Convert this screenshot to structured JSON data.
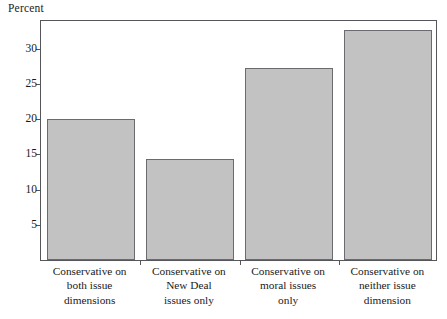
{
  "chart_data": {
    "type": "bar",
    "title": "",
    "ylabel": "Percent",
    "xlabel": "",
    "categories": [
      "Conservative on both issue dimensions",
      "Conservative on New Deal issues only",
      "Conservative on moral issues only",
      "Conservative on neither issue dimension"
    ],
    "category_lines": [
      [
        "Conservative on",
        "both issue",
        "dimensions"
      ],
      [
        "Conservative on",
        "New Deal",
        "issues only"
      ],
      [
        "Conservative on",
        "moral issues",
        "only"
      ],
      [
        "Conservative on",
        "neither issue",
        "dimension"
      ]
    ],
    "values": [
      20.0,
      14.4,
      27.3,
      32.7
    ],
    "ylim": [
      0,
      34.2
    ],
    "yticks": [
      5,
      10,
      15,
      20,
      25,
      30
    ],
    "ytick_labels": [
      "5",
      "10",
      "15",
      "20",
      "25",
      "30"
    ],
    "grid": false,
    "legend": null,
    "bar_fill_color": "#c2c2c2",
    "bar_edge_color": "#6b6b6f",
    "frame_color": "#55555a",
    "background_color": "#ffffff"
  }
}
